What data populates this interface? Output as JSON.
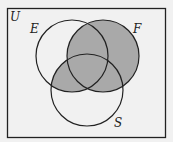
{
  "diagram": {
    "type": "venn",
    "universe_label": "U",
    "sets": [
      {
        "name": "E",
        "label": "E"
      },
      {
        "name": "F",
        "label": "F"
      },
      {
        "name": "S",
        "label": "S"
      }
    ],
    "shaded_region": "F ∪ (E ∩ S)",
    "colors": {
      "background": "#f1f1f1",
      "shade": "#a9a9a9",
      "stroke": "#222222"
    }
  }
}
